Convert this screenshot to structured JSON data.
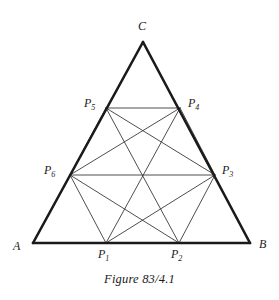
{
  "figure": {
    "caption": "Figure 83/4.1",
    "caption_position": {
      "x": 0,
      "y": 272
    },
    "background_color": "#ffffff",
    "stroke_color_outer": "#1a1a1a",
    "stroke_color_inner": "#3a3a3a",
    "stroke_width_outer": 2.6,
    "stroke_width_inner": 0.9,
    "canvas": {
      "width": 279,
      "height": 300
    }
  },
  "labels": {
    "A": {
      "text": "A",
      "sub": "",
      "x": 13,
      "y": 240
    },
    "B": {
      "text": "B",
      "sub": "",
      "x": 259,
      "y": 238
    },
    "C": {
      "text": "C",
      "sub": "",
      "x": 138,
      "y": 20
    },
    "P1": {
      "text": "P",
      "sub": "1",
      "x": 98,
      "y": 248
    },
    "P2": {
      "text": "P",
      "sub": "2",
      "x": 171,
      "y": 248
    },
    "P3": {
      "text": "P",
      "sub": "3",
      "x": 222,
      "y": 164
    },
    "P4": {
      "text": "P",
      "sub": "4",
      "x": 188,
      "y": 97
    },
    "P5": {
      "text": "P",
      "sub": "5",
      "x": 84,
      "y": 97
    },
    "P6": {
      "text": "P",
      "sub": "6",
      "x": 44,
      "y": 164
    }
  },
  "points": {
    "A": {
      "x": 33,
      "y": 243
    },
    "B": {
      "x": 250,
      "y": 243
    },
    "C": {
      "x": 143,
      "y": 42
    },
    "P1": {
      "x": 106,
      "y": 243
    },
    "P2": {
      "x": 179,
      "y": 243
    },
    "P3": {
      "x": 215,
      "y": 175
    },
    "P4": {
      "x": 180,
      "y": 108
    },
    "P5": {
      "x": 106,
      "y": 108
    },
    "P6": {
      "x": 70,
      "y": 175
    }
  },
  "edges": {
    "triangle": [
      {
        "name": "side-AB",
        "from": "A",
        "to": "B"
      },
      {
        "name": "side-BC",
        "from": "B",
        "to": "C"
      },
      {
        "name": "side-CA",
        "from": "C",
        "to": "A"
      }
    ],
    "hexagon": [
      {
        "name": "hex-P1-P2",
        "from": "P1",
        "to": "P2"
      },
      {
        "name": "hex-P2-P3",
        "from": "P2",
        "to": "P3"
      },
      {
        "name": "hex-P3-P4",
        "from": "P3",
        "to": "P4"
      },
      {
        "name": "hex-P4-P5",
        "from": "P4",
        "to": "P5"
      },
      {
        "name": "hex-P5-P6",
        "from": "P5",
        "to": "P6"
      },
      {
        "name": "hex-P6-P1",
        "from": "P6",
        "to": "P1"
      }
    ],
    "diagonals": [
      {
        "name": "diag-P1-P4",
        "from": "P1",
        "to": "P4"
      },
      {
        "name": "diag-P2-P5",
        "from": "P2",
        "to": "P5"
      },
      {
        "name": "diag-P3-P6",
        "from": "P3",
        "to": "P6"
      },
      {
        "name": "diag-P1-P3",
        "from": "P1",
        "to": "P3"
      },
      {
        "name": "diag-P2-P6",
        "from": "P2",
        "to": "P6"
      },
      {
        "name": "diag-P3-P5",
        "from": "P3",
        "to": "P5"
      },
      {
        "name": "diag-P4-P6",
        "from": "P4",
        "to": "P6"
      }
    ]
  }
}
